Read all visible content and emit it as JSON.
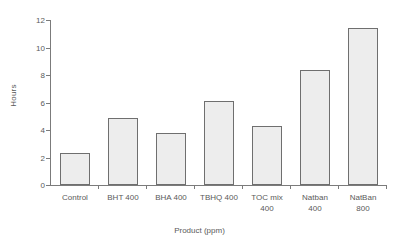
{
  "chart_data": {
    "type": "bar",
    "title": "",
    "xlabel": "Product (ppm)",
    "ylabel": "Hours",
    "categories": [
      "Control",
      "BHT 400",
      "BHA 400",
      "TBHQ 400",
      "TOC mix\n400",
      "Natban\n400",
      "NatBan\n800"
    ],
    "values": [
      2.3,
      4.9,
      3.8,
      6.1,
      4.3,
      8.4,
      11.4
    ],
    "ylim": [
      0,
      12
    ],
    "ytick_values": [
      0,
      2,
      4,
      6,
      8,
      10,
      12
    ],
    "ytick_labels": [
      "0",
      "2",
      "4",
      "6",
      "8",
      "10",
      "12"
    ],
    "grid": false,
    "legend": false,
    "bar_fill_color": "#ededed",
    "bar_border_color": "#6f6f6f",
    "axis_color": "#7b7b7b",
    "text_color": "#5a5a5a"
  }
}
